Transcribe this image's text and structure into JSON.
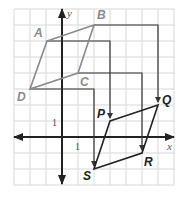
{
  "figure": {
    "axes": {
      "x_label": "x",
      "y_label": "y",
      "x_tick": "1",
      "y_tick": "1"
    },
    "grid": {
      "x_min": -3,
      "x_max": 7,
      "y_min": -3,
      "y_max": 8,
      "spacing_px": 16,
      "origin_px": [
        62,
        137
      ]
    },
    "preimage": {
      "name": "ABCD",
      "color": "#8a8a8a",
      "vertices": [
        {
          "label": "A",
          "x": -1,
          "y": 6
        },
        {
          "label": "B",
          "x": 2,
          "y": 7
        },
        {
          "label": "C",
          "x": 1,
          "y": 4
        },
        {
          "label": "D",
          "x": -2,
          "y": 3
        }
      ]
    },
    "image": {
      "name": "PQRS",
      "color": "#222222",
      "vertices": [
        {
          "label": "P",
          "x": 3,
          "y": 1
        },
        {
          "label": "Q",
          "x": 6,
          "y": 2
        },
        {
          "label": "R",
          "x": 5,
          "y": -1
        },
        {
          "label": "S",
          "x": 2,
          "y": -2
        }
      ]
    },
    "translation": {
      "dx": 4,
      "dy": -5
    },
    "mappings": [
      {
        "from": "A",
        "to": "P"
      },
      {
        "from": "B",
        "to": "Q"
      },
      {
        "from": "C",
        "to": "R"
      },
      {
        "from": "D",
        "to": "S"
      }
    ]
  }
}
